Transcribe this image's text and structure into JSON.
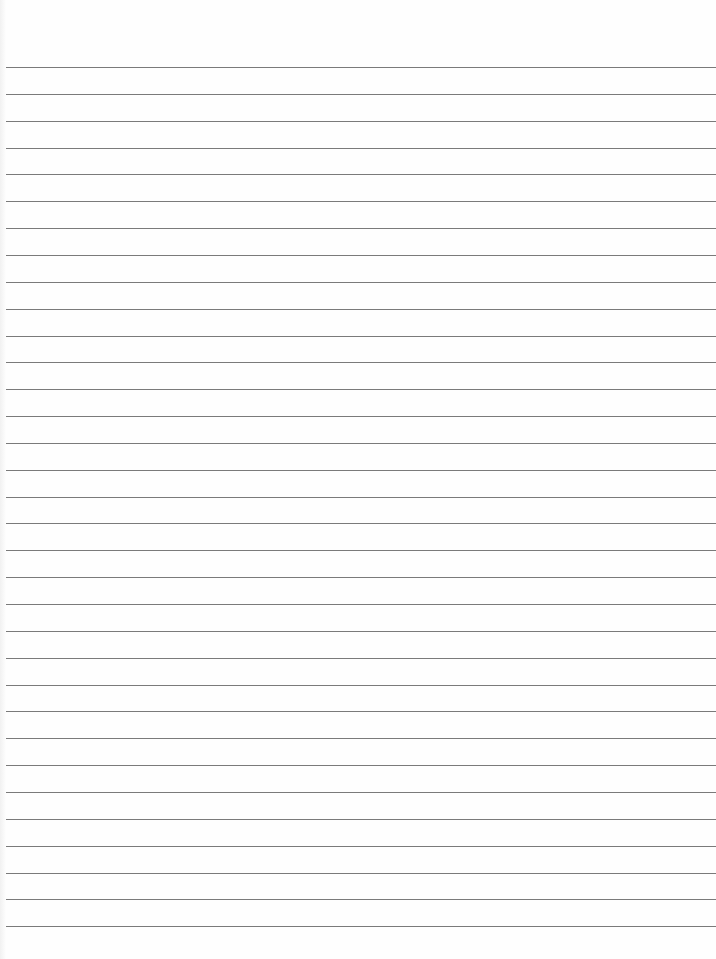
{
  "page": {
    "type": "lined-paper",
    "background_color": "#fefefe",
    "line_color": "#7a7a7a",
    "line_count": 33,
    "first_line_y": 67,
    "line_spacing": 26.85
  }
}
